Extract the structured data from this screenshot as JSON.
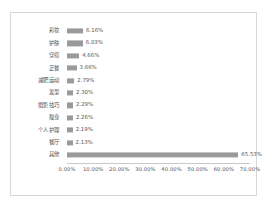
{
  "chart_data": {
    "type": "bar",
    "orientation": "horizontal",
    "title": "",
    "subtitle": "",
    "xlabel": "",
    "ylabel": "",
    "categories": [
      "彩妆",
      "护肤",
      "穿搭",
      "正餐",
      "减肥运动",
      "发型",
      "摄影技巧",
      "瘦身",
      "个人护理",
      "餐厅",
      "其他"
    ],
    "values": [
      6.16,
      6.03,
      4.66,
      3.66,
      2.79,
      2.3,
      2.29,
      2.26,
      2.19,
      2.13,
      65.53
    ],
    "value_labels": [
      "6.16%",
      "6.03%",
      "4.66%",
      "3.66%",
      "2.79%",
      "2.30%",
      "2.29%",
      "2.26%",
      "2.19%",
      "2.13%",
      "65.53%"
    ],
    "xlim": [
      0,
      70
    ],
    "xticks": [
      0,
      10,
      20,
      30,
      40,
      50,
      60,
      70
    ],
    "xtick_labels": [
      "0.00%",
      "10.00%",
      "20.00%",
      "30.00%",
      "40.00%",
      "50.00%",
      "60.00%",
      "70.00%"
    ],
    "grid": false,
    "legend": "none",
    "bar_color": "#9a9a9a",
    "axis_color": "#c9c9c9",
    "text_color": "#555555",
    "border_color": "#d8d8d8",
    "background": "#ffffff"
  }
}
